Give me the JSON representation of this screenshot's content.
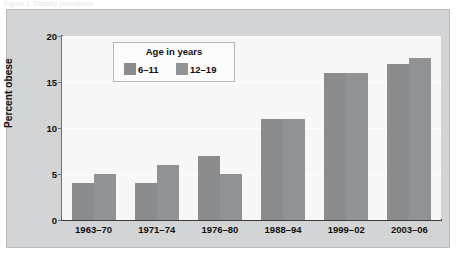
{
  "caption": {
    "text": "Figure 1. Obesity prevalence"
  },
  "chart_data": {
    "type": "bar",
    "title": "",
    "xlabel": "",
    "ylabel": "Percent obese",
    "ylim": [
      0,
      20
    ],
    "yticks": [
      0,
      5,
      10,
      15,
      20
    ],
    "ytick_labels": [
      "0",
      "5",
      "10",
      "15",
      "20"
    ],
    "grid": true,
    "legend_position": "upper-left-inside",
    "legend_title": "Age in years",
    "categories": [
      "1963–70",
      "1971–74",
      "1976–80",
      "1988–94",
      "1999–02",
      "2003–06"
    ],
    "series": [
      {
        "name": "6–11",
        "color": "#8b8c8d",
        "values": [
          4,
          4,
          7,
          11,
          16,
          17
        ]
      },
      {
        "name": "12–19",
        "color": "#919293",
        "values": [
          5,
          6,
          5,
          11,
          16,
          17.6
        ]
      }
    ]
  },
  "colors": {
    "panel_background": "#d3d4d5",
    "plot_background": "#f7f7f7",
    "gridline": "#ffffff",
    "axis": "#3b3c3d",
    "text": "#111111"
  }
}
